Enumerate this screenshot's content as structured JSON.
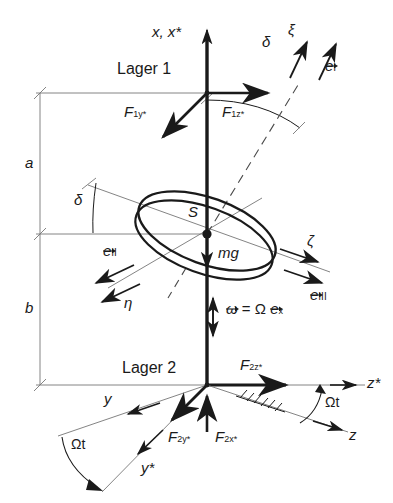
{
  "figure": {
    "bearings": {
      "upper_label": "Lager 1",
      "lower_label": "Lager 2"
    },
    "dimensions": {
      "upper_label": "a",
      "lower_label": "b"
    },
    "center_of_mass_label": "S",
    "weight_label": "mg",
    "angles": {
      "delta_top": "δ",
      "delta_disk": "δ",
      "omega_t_bottom_right": "Ωt",
      "omega_t_bottom_left": "Ωt"
    },
    "axes": {
      "x_star": "x, x*",
      "z_star": "z*",
      "z": "z",
      "y": "y",
      "y_star": "y*",
      "xi": "ξ",
      "eta": "η",
      "zeta": "ζ"
    },
    "unit_vectors": {
      "e_one": {
        "base": "e",
        "sub": "I"
      },
      "e_two": {
        "base": "e",
        "sub": "II"
      },
      "e_three": {
        "base": "e",
        "sub": "III"
      }
    },
    "forces": {
      "f1y_star": {
        "base": "F",
        "sub": "1y*"
      },
      "f1z_star": {
        "base": "F",
        "sub": "1z*"
      },
      "f2z_star": {
        "base": "F",
        "sub": "2z*"
      },
      "f2y_star": {
        "base": "F",
        "sub": "2y*"
      },
      "f2x_star": {
        "base": "F",
        "sub": "2x*"
      }
    },
    "angular_velocity": {
      "omega": "ω",
      "equals": "=",
      "omega_cap": "Ω",
      "e_x_base": "e",
      "e_x_sub": "x"
    },
    "colors": {
      "ink": "#1a1a1a",
      "thin": "#6e6e6e",
      "background": "#ffffff"
    }
  }
}
